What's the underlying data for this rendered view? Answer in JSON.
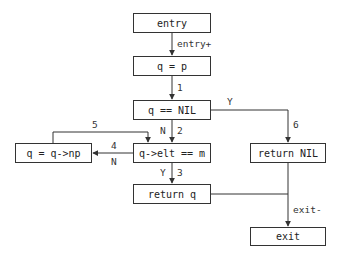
{
  "diagram": {
    "type": "control-flow-graph",
    "nodes": [
      {
        "id": "entry",
        "label": "entry"
      },
      {
        "id": "assign_q",
        "label": "q = p"
      },
      {
        "id": "test_nil",
        "label": "q == NIL"
      },
      {
        "id": "test_elt",
        "label": "q->elt == m"
      },
      {
        "id": "advance",
        "label": "q = q->np"
      },
      {
        "id": "return_q",
        "label": "return q"
      },
      {
        "id": "return_nil",
        "label": "return NIL"
      },
      {
        "id": "exit",
        "label": "exit"
      }
    ],
    "edges": [
      {
        "from": "entry",
        "to": "assign_q",
        "label": "entry+"
      },
      {
        "from": "assign_q",
        "to": "test_nil",
        "label": "1"
      },
      {
        "from": "test_nil",
        "to": "test_elt",
        "label": "2",
        "branch": "N"
      },
      {
        "from": "test_elt",
        "to": "return_q",
        "label": "3",
        "branch": "Y"
      },
      {
        "from": "test_elt",
        "to": "advance",
        "label": "4",
        "branch": "N"
      },
      {
        "from": "advance",
        "to": "test_elt",
        "label": "5"
      },
      {
        "from": "test_nil",
        "to": "return_nil",
        "label": "6",
        "branch": "Y"
      },
      {
        "from": "return_nil",
        "to": "exit",
        "label": "exit-"
      },
      {
        "from": "return_q",
        "to": "exit",
        "label": ""
      }
    ],
    "edge_labels": {
      "entry_plus": "entry+",
      "e1": "1",
      "e2_branch": "N",
      "e2": "2",
      "e3_branch": "Y",
      "e3": "3",
      "e4": "4",
      "e4_branch": "N",
      "e5": "5",
      "e6_branch": "Y",
      "e6": "6",
      "exit_minus": "exit-"
    },
    "colors": {
      "line": "#333333",
      "box_border": "#333333",
      "background": "#ffffff",
      "text": "#222222"
    }
  }
}
